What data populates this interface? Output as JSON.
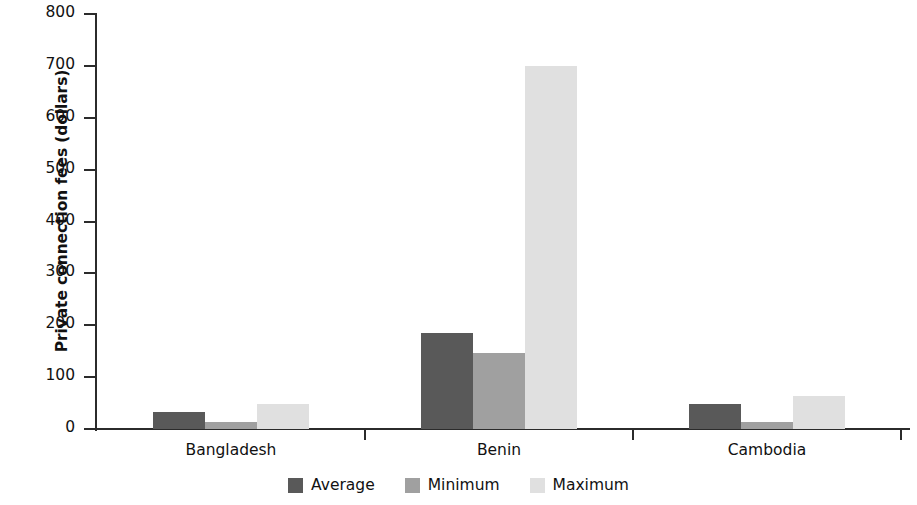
{
  "chart_data": {
    "type": "bar",
    "title": "",
    "xlabel": "",
    "ylabel": "Private connection fees (dollars)",
    "categories": [
      "Bangladesh",
      "Benin",
      "Cambodia"
    ],
    "series": [
      {
        "name": "Average",
        "color": "#595959",
        "values": [
          33,
          185,
          48
        ]
      },
      {
        "name": "Minimum",
        "color": "#a0a0a0",
        "values": [
          14,
          147,
          14
        ]
      },
      {
        "name": "Maximum",
        "color": "#e0e0e0",
        "values": [
          48,
          700,
          64
        ]
      }
    ],
    "ylim": [
      0,
      800
    ],
    "yticks": [
      0,
      100,
      200,
      300,
      400,
      500,
      600,
      700,
      800
    ],
    "ytick_labels": [
      "0",
      "100",
      "200",
      "300",
      "400",
      "500",
      "600",
      "700",
      "800"
    ],
    "grid": false,
    "legend_position": "bottom"
  },
  "legend": {
    "items": [
      {
        "label": "Average",
        "color": "#595959"
      },
      {
        "label": "Minimum",
        "color": "#a0a0a0"
      },
      {
        "label": "Maximum",
        "color": "#e0e0e0"
      }
    ]
  }
}
